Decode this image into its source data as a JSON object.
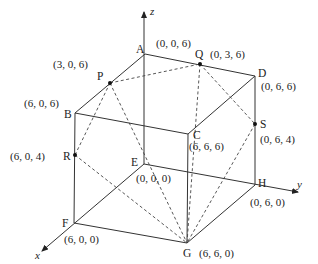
{
  "diagram": {
    "type": "cube-coordinate-diagram",
    "axes": {
      "x": "x",
      "y": "y",
      "z": "z"
    },
    "vertices": {
      "A": {
        "name": "A",
        "coord": "(0,  0,  6)",
        "pos": [
          145,
          54
        ]
      },
      "B": {
        "name": "B",
        "coord": "(6,  0,  6)",
        "pos": [
          75,
          113
        ]
      },
      "C": {
        "name": "C",
        "coord": "(6,  6,  6)",
        "pos": [
          188,
          134
        ]
      },
      "D": {
        "name": "D",
        "coord": "(0,  6,  6)",
        "pos": [
          255,
          76
        ]
      },
      "E": {
        "name": "E",
        "coord": "(0,  0,  0)",
        "pos": [
          144,
          164
        ]
      },
      "F": {
        "name": "F",
        "coord": "(6,  0,  0)",
        "pos": [
          74,
          223
        ]
      },
      "G": {
        "name": "G",
        "coord": "(6,  6,  0)",
        "pos": [
          187,
          243
        ]
      },
      "H": {
        "name": "H",
        "coord": "(0,  6,  0)",
        "pos": [
          255,
          185
        ]
      }
    },
    "points": {
      "P": {
        "name": "P",
        "coord": "(3,  0,  6)",
        "pos": [
          110,
          83
        ]
      },
      "Q": {
        "name": "Q",
        "coord": "(0,  3,  6)",
        "pos": [
          200,
          64
        ]
      },
      "R": {
        "name": "R",
        "coord": "(6,  0,  4)",
        "pos": [
          75,
          155
        ]
      },
      "S": {
        "name": "S",
        "coord": "(0,  6,  4)",
        "pos": [
          255,
          124
        ]
      }
    },
    "solid_edges": [
      [
        "A",
        "B"
      ],
      [
        "A",
        "D"
      ],
      [
        "B",
        "C"
      ],
      [
        "C",
        "D"
      ],
      [
        "B",
        "F"
      ],
      [
        "C",
        "G"
      ],
      [
        "D",
        "H"
      ],
      [
        "F",
        "G"
      ],
      [
        "G",
        "H"
      ]
    ],
    "dashed_edges": [
      [
        "P",
        "Q"
      ],
      [
        "P",
        "R"
      ],
      [
        "P",
        "G"
      ],
      [
        "Q",
        "S"
      ],
      [
        "Q",
        "G"
      ],
      [
        "R",
        "G"
      ],
      [
        "S",
        "G"
      ]
    ],
    "colors": {
      "line": "#333333",
      "dash": "#444444",
      "text": "#222222"
    }
  }
}
